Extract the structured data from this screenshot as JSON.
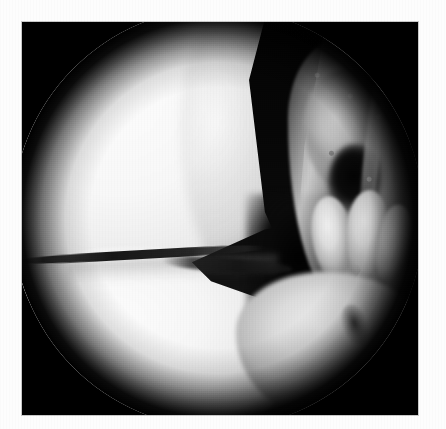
{
  "page": {
    "background_color": "#fdfdfd",
    "width": 446,
    "height": 429
  },
  "figure": {
    "name": "arthroscopic-photograph",
    "kind": "endoscopic-still",
    "frame": {
      "x": 22,
      "y": 22,
      "width": 396,
      "height": 393,
      "background_color": "#000000",
      "border_color": "#c9c9c9"
    },
    "scope_field": {
      "shape": "circle",
      "center_x": 196,
      "center_y": 196,
      "radius": 206,
      "vignette_color": "#000000",
      "highlight_color": "#fdfdfd"
    },
    "caption": "",
    "regions": [
      {
        "name": "femoral-condyle",
        "label": "Femoral condyle",
        "tone": "bright",
        "color": "#f8f8f8",
        "position": "left-center"
      },
      {
        "name": "intercondylar-notch",
        "label": "Intercondylar notch",
        "tone": "dark",
        "color": "#060606",
        "position": "top-center"
      },
      {
        "name": "notch-gutter",
        "label": "Notch gutter",
        "tone": "dark",
        "color": "#111111",
        "position": "center-lower"
      },
      {
        "name": "acl-synovial-tissue",
        "label": "ACL / synovial tissue",
        "tone": "mid-mottled",
        "color": "#b4b4b4",
        "position": "right"
      },
      {
        "name": "fat-pad-lobes",
        "label": "Fat pad lobes",
        "tone": "bright",
        "color": "#dcdcdc",
        "position": "right-lower"
      },
      {
        "name": "tibial-plateau",
        "label": "Tibial plateau",
        "tone": "mid-bright",
        "color": "#dcdcdc",
        "position": "bottom-right"
      },
      {
        "name": "meniscal-surface",
        "label": "Meniscal / tibial surface",
        "tone": "bright",
        "color": "#f7f7f7",
        "position": "bottom-left"
      },
      {
        "name": "meniscal-edge-line",
        "label": "Meniscal free edge",
        "tone": "thin-dark-line",
        "color": "#0f0f0f",
        "position": "left-center"
      }
    ]
  }
}
